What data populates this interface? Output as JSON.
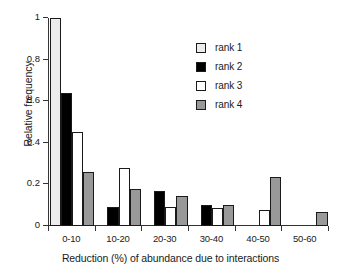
{
  "chart_data": {
    "type": "bar",
    "title": "",
    "xlabel": "Reduction (%) of abundance due to interactions",
    "ylabel": "Relative frequency",
    "categories": [
      "0-10",
      "10-20",
      "20-30",
      "30-40",
      "40-50",
      "50-60"
    ],
    "series": [
      {
        "name": "rank 1",
        "color": "#ececec",
        "values": [
          1.0,
          0,
          0,
          0,
          0,
          0
        ]
      },
      {
        "name": "rank 2",
        "color": "#000000",
        "values": [
          0.64,
          0.09,
          0.17,
          0.1,
          0,
          0
        ]
      },
      {
        "name": "rank 3",
        "color": "#ffffff",
        "values": [
          0.45,
          0.28,
          0.09,
          0.085,
          0.075,
          0
        ]
      },
      {
        "name": "rank 4",
        "color": "#999999",
        "values": [
          0.26,
          0.18,
          0.145,
          0.1,
          0.235,
          0.065
        ]
      }
    ],
    "ylim": [
      0,
      1
    ],
    "yticks": [
      0,
      0.2,
      0.4,
      0.6,
      0.8,
      1
    ],
    "ytick_labels": [
      "0",
      "0.2",
      "0.4",
      "0.6",
      "0.8",
      "1"
    ],
    "grid": false,
    "legend_position": "top-right",
    "bar_edge_color": "#1a1a1a",
    "axis_color": "#333333"
  }
}
